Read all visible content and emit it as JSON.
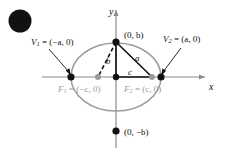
{
  "figure": {
    "type": "ellipse-geometry-diagram",
    "background_color": "#ffffff",
    "colors": {
      "ellipse_curve": "#9a9a9a",
      "axis": "#8c8c8c",
      "focus_label": "#9a9a9a",
      "vertex_dot": "#111111",
      "focus_dot": "#9a9a9a",
      "triangle_stroke": "#111111",
      "blob": "#111111"
    },
    "axes": {
      "x_label": "x",
      "y_label": "y",
      "origin": [
        116,
        77
      ]
    },
    "labels": {
      "vertex_left": {
        "name": "V",
        "subscript": "1",
        "value": "= (−a, 0)"
      },
      "vertex_right": {
        "name": "V",
        "subscript": "2",
        "value": "= (a, 0)"
      },
      "focus_left": {
        "name": "F",
        "subscript": "1",
        "value": "= (−c, 0)"
      },
      "focus_right": {
        "name": "F",
        "subscript": "2",
        "value": "= (c, 0)"
      },
      "co_vertex_top": "(0, b)",
      "co_vertex_bottom": "(0, −b)",
      "side_a": "a",
      "side_b": "b",
      "side_c": "c"
    },
    "points": {
      "vertex_left": [
        71,
        77
      ],
      "vertex_right": [
        161,
        77
      ],
      "co_vertex_top": [
        116,
        42
      ],
      "co_vertex_bottom": [
        116,
        131
      ],
      "focus_left": [
        98,
        77
      ],
      "focus_right": [
        152,
        77
      ],
      "center": [
        116,
        77
      ]
    },
    "segments": [
      {
        "name": "b-semi-minor",
        "from": "co_vertex_top",
        "to": "center",
        "style": "solid"
      },
      {
        "name": "a-hypotenuse",
        "from": "co_vertex_top",
        "to": "focus_right",
        "style": "solid"
      },
      {
        "name": "c-semi-focal",
        "from": "center",
        "to": "focus_right",
        "style": "solid"
      },
      {
        "name": "a-mirror",
        "from": "co_vertex_top",
        "to": "focus_left",
        "style": "dashed"
      }
    ],
    "ellipse": {
      "cx": 116,
      "cy": 77,
      "rx": 45,
      "ry": 34
    }
  }
}
